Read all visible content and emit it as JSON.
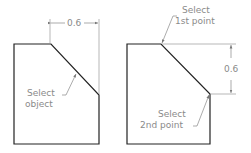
{
  "left_figure": {
    "dimension": "0.6",
    "label_line1": "Select",
    "label_line2": "object"
  },
  "right_figure": {
    "dimension": "0.6",
    "top_label_line1": "Select",
    "top_label_line2": "1st point",
    "bottom_label_line1": "Select",
    "bottom_label_line2": "2nd point"
  },
  "colors": {
    "outline": "#222222",
    "annotation": "#8a8a8a"
  }
}
